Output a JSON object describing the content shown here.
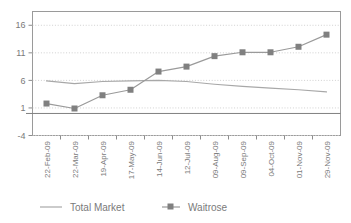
{
  "chart_data": {
    "type": "line",
    "title": "",
    "subtitle": "",
    "xlabel": "",
    "ylabel": "",
    "categories": [
      "22-Feb-09",
      "22-Mar-09",
      "19-Apr-09",
      "17-May-09",
      "14-Jun-09",
      "12-Jul-09",
      "09-Aug-09",
      "09-Sep-09",
      "04-Oct-09",
      "01-Nov-09",
      "29-Nov-09"
    ],
    "series": [
      {
        "name": "Total Market",
        "style": "line",
        "color": "#a8a8a8",
        "values": [
          5.9,
          5.4,
          5.8,
          5.9,
          6.0,
          5.8,
          5.3,
          4.9,
          4.6,
          4.3,
          3.9
        ]
      },
      {
        "name": "Waitrose",
        "style": "line-with-square-markers",
        "color": "#9a9a9a",
        "marker_color": "#808080",
        "values": [
          1.8,
          0.9,
          3.3,
          4.3,
          7.6,
          8.5,
          10.4,
          11.1,
          11.1,
          12.1,
          14.3
        ]
      }
    ],
    "yticks": [
      -4,
      1,
      6,
      11,
      16
    ],
    "ytick_labels": [
      "-4",
      "1",
      "6",
      "11",
      "16"
    ],
    "ylim": [
      -4,
      18.5
    ],
    "grid": "horizontal-dotted",
    "zero_line": true,
    "legend_position": "bottom"
  },
  "legend": {
    "items": [
      {
        "label": "Total Market",
        "marker": "line-swatch"
      },
      {
        "label": "Waitrose",
        "marker": "line-square-swatch"
      }
    ]
  },
  "colors": {
    "axis": "#8c8c8c",
    "grid": "#d0d0d0",
    "total_market": "#a8a8a8",
    "waitrose_line": "#9a9a9a",
    "waitrose_marker": "#808080",
    "text": "#7a7a7a",
    "background": "#ffffff"
  }
}
